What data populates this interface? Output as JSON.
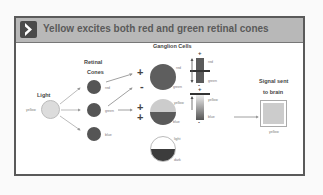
{
  "header": {
    "title": "Yellow excites both red and green retinal cones",
    "icon": "chevron-right-icon"
  },
  "light": {
    "heading": "Light",
    "stimulus_label": "yellow",
    "stimulus_color": "#d8d8d8"
  },
  "cones": {
    "heading_line1": "Retinal",
    "heading_line2": "Cones",
    "items": [
      {
        "label": "red"
      },
      {
        "label": "green"
      },
      {
        "label": "blue"
      }
    ]
  },
  "ganglion": {
    "heading": "Ganglion Cells",
    "cells": [
      {
        "top_label": "red",
        "bottom_label": "green",
        "sign_top": "+",
        "sign_bottom": "-"
      },
      {
        "top_label": "yellow",
        "bottom_label": "blue",
        "sign_top": "+",
        "sign_bottom": "+"
      },
      {
        "top_label": "light",
        "bottom_label": "dark"
      }
    ],
    "bars": [
      {
        "top_label": "red",
        "bottom_label": "green",
        "plus": "+",
        "minus": "-"
      },
      {
        "top_label": "yellow",
        "bottom_label": "blue",
        "plus": "+",
        "minus": "-"
      }
    ]
  },
  "output": {
    "heading_line1": "Signal sent",
    "heading_line2": "to brain",
    "swatch_label": "yellow",
    "swatch_color": "#cccccc"
  }
}
